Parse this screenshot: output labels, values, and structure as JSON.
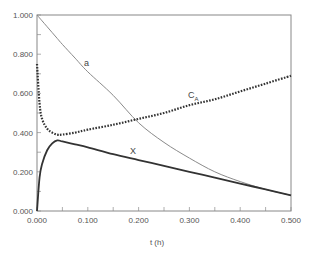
{
  "chart_data": {
    "type": "line",
    "title": "",
    "xlabel": "t (h)",
    "ylabel": "",
    "xlim": [
      0.0,
      0.5
    ],
    "ylim": [
      0.0,
      1.0
    ],
    "grid": false,
    "legend": "inline curve labels",
    "x_ticks": [
      "0.000",
      "0.100",
      "0.200",
      "0.300",
      "0.400",
      "0.500"
    ],
    "y_ticks": [
      "0.000",
      "0.200",
      "0.400",
      "0.600",
      "0.800",
      "1.000"
    ],
    "x": [
      0.0,
      0.005,
      0.01,
      0.02,
      0.03,
      0.04,
      0.05,
      0.075,
      0.1,
      0.15,
      0.2,
      0.25,
      0.3,
      0.35,
      0.4,
      0.45,
      0.5
    ],
    "series": [
      {
        "name": "a",
        "style": "thin solid",
        "values": [
          1.0,
          0.985,
          0.97,
          0.94,
          0.91,
          0.88,
          0.85,
          0.78,
          0.71,
          0.59,
          0.45,
          0.35,
          0.27,
          0.2,
          0.15,
          0.11,
          0.08
        ]
      },
      {
        "name": "C_A",
        "style": "dotted",
        "values": [
          0.75,
          0.55,
          0.47,
          0.42,
          0.4,
          0.39,
          0.39,
          0.4,
          0.415,
          0.44,
          0.47,
          0.5,
          0.54,
          0.57,
          0.61,
          0.65,
          0.69
        ]
      },
      {
        "name": "X",
        "style": "thick solid",
        "values": [
          0.0,
          0.17,
          0.24,
          0.31,
          0.345,
          0.36,
          0.355,
          0.34,
          0.325,
          0.29,
          0.26,
          0.23,
          0.2,
          0.17,
          0.14,
          0.11,
          0.08
        ]
      }
    ],
    "annotations": [
      {
        "text": "a",
        "x": 0.1,
        "y": 0.8
      },
      {
        "text": "C",
        "subscript": "A",
        "x": 0.225,
        "y": 0.58
      },
      {
        "text": "X",
        "x": 0.19,
        "y": 0.3
      }
    ]
  },
  "labels": {
    "curve_a": "a",
    "curve_ca": "C",
    "curve_ca_sub": "A",
    "curve_x": "X",
    "xlabel": "t (h)"
  }
}
